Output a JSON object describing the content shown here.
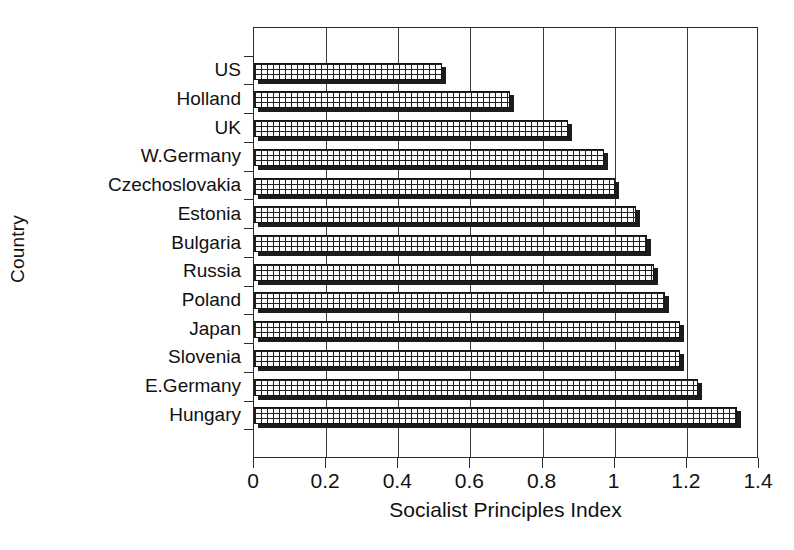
{
  "chart_data": {
    "type": "bar",
    "orientation": "horizontal",
    "title": "",
    "xlabel": "Socialist Principles Index",
    "ylabel": "Country",
    "categories": [
      "US",
      "Holland",
      "UK",
      "W.Germany",
      "Czechoslovakia",
      "Estonia",
      "Bulgaria",
      "Russia",
      "Poland",
      "Japan",
      "Slovenia",
      "E.Germany",
      "Hungary"
    ],
    "values": [
      0.52,
      0.71,
      0.87,
      0.97,
      1.0,
      1.06,
      1.09,
      1.11,
      1.14,
      1.18,
      1.18,
      1.23,
      1.34
    ],
    "xlim": [
      0,
      1.4
    ],
    "xticks": [
      0,
      0.2,
      0.4,
      0.6,
      0.8,
      1,
      1.2,
      1.4
    ],
    "xticklabels": [
      "0",
      "0.2",
      "0.4",
      "0.6",
      "0.8",
      "1",
      "1.2",
      "1.4"
    ],
    "grid": "vertical",
    "legend": "none",
    "bar_fill": "crosshatch-grid",
    "bar_style": "3d-shadow",
    "colors": {
      "background": "#ffffff",
      "axis": "#2b2b2b",
      "grid": "#3a3a3a",
      "bar_face": "#fdfdfd",
      "bar_pattern": "#202020",
      "bar_shadow": "#1c1c1c",
      "text": "#111111"
    }
  }
}
